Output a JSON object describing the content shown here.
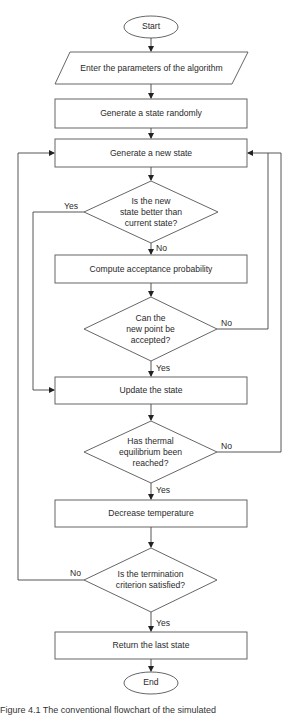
{
  "diagram": {
    "type": "flowchart",
    "nodes": {
      "start": "Start",
      "input": "Enter the parameters of the algorithm",
      "gen_random": "Generate a state randomly",
      "gen_new": "Generate a new state",
      "d_better": "Is the new state better than current state?",
      "d_better_lines": [
        "Is the new",
        "state better than",
        "current state?"
      ],
      "compute": "Compute acceptance probability",
      "d_accept_lines": [
        "Can the",
        "new point be",
        "accepted?"
      ],
      "update": "Update the state",
      "d_equil_lines": [
        "Has thermal",
        "equilibrium been",
        "reached?"
      ],
      "decrease": "Decrease temperature",
      "d_term_lines": [
        "Is the termination",
        "criterion satisfied?"
      ],
      "ret": "Return the last state",
      "end": "End"
    },
    "branches": {
      "better_yes": "Yes",
      "better_no": "No",
      "accept_no": "No",
      "accept_yes": "Yes",
      "equil_no": "No",
      "equil_yes": "Yes",
      "term_no": "No",
      "term_yes": "Yes"
    },
    "edges": [
      {
        "from": "start",
        "to": "input"
      },
      {
        "from": "input",
        "to": "gen_random"
      },
      {
        "from": "gen_random",
        "to": "gen_new"
      },
      {
        "from": "gen_new",
        "to": "d_better"
      },
      {
        "from": "d_better",
        "to": "update",
        "label": "Yes"
      },
      {
        "from": "d_better",
        "to": "compute",
        "label": "No"
      },
      {
        "from": "compute",
        "to": "d_accept"
      },
      {
        "from": "d_accept",
        "to": "gen_new",
        "label": "No"
      },
      {
        "from": "d_accept",
        "to": "update",
        "label": "Yes"
      },
      {
        "from": "update",
        "to": "d_equil"
      },
      {
        "from": "d_equil",
        "to": "gen_new",
        "label": "No"
      },
      {
        "from": "d_equil",
        "to": "decrease",
        "label": "Yes"
      },
      {
        "from": "decrease",
        "to": "d_term"
      },
      {
        "from": "d_term",
        "to": "gen_new",
        "label": "No"
      },
      {
        "from": "d_term",
        "to": "ret",
        "label": "Yes"
      },
      {
        "from": "ret",
        "to": "end"
      }
    ],
    "caption": "Figure 4.1 The conventional flowchart of the simulated"
  }
}
